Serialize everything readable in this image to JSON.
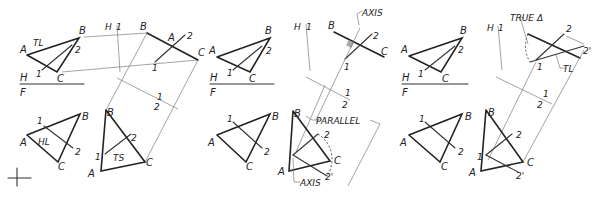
{
  "figure": {
    "panels": [
      {
        "id": "panel-1",
        "top_view_labels": {
          "A": "A",
          "B": "B",
          "C": "C",
          "p1": "1",
          "p2": "2",
          "tl": "TL"
        },
        "fold_line": {
          "upper": "H",
          "lower": "F"
        },
        "front_view_labels": {
          "A": "A",
          "B": "B",
          "C": "C",
          "p1": "1",
          "p2": "2",
          "hl": "HL"
        },
        "aux_view_labels": {
          "h": "H",
          "one": "1",
          "B": "B",
          "A": "A",
          "C": "C",
          "p1": "1",
          "p2": "2"
        },
        "aux_fold": {
          "one": "1",
          "two": "2"
        },
        "second_aux_labels": {
          "B": "B",
          "A": "A",
          "C": "C",
          "p1": "1",
          "p2": "2",
          "ts": "TS"
        }
      },
      {
        "id": "panel-2",
        "top_view_labels": {
          "A": "A",
          "B": "B",
          "C": "C",
          "p1": "1",
          "p2": "2"
        },
        "fold_line": {
          "upper": "H",
          "lower": "F"
        },
        "front_view_labels": {
          "A": "A",
          "B": "B",
          "C": "C",
          "p1": "1",
          "p2": "2"
        },
        "aux_view_labels": {
          "h": "H",
          "one": "1",
          "B": "B",
          "C": "C",
          "p1": "1",
          "p2": "2",
          "axis": "AXIS"
        },
        "aux_fold": {
          "one": "1",
          "two": "2"
        },
        "second_aux_labels": {
          "B": "B",
          "A": "A",
          "C": "C",
          "p2": "2",
          "p2p": "2'",
          "parallel": "PARALLEL",
          "axis": "AXIS"
        }
      },
      {
        "id": "panel-3",
        "top_view_labels": {
          "A": "A",
          "B": "B",
          "C": "C",
          "p1": "1",
          "p2": "2"
        },
        "fold_line": {
          "upper": "H",
          "lower": "F"
        },
        "front_view_labels": {
          "A": "A",
          "B": "B",
          "C": "C",
          "p1": "1",
          "p2": "2"
        },
        "aux_view_labels": {
          "h": "H",
          "one": "1",
          "p1": "1",
          "p2": "2",
          "p2p": "2'",
          "true_angle": "TRUE Δ",
          "tl": "TL"
        },
        "aux_fold": {
          "one": "1",
          "two": "2"
        },
        "second_aux_labels": {
          "B": "B",
          "A": "A",
          "C": "C",
          "p1": "1",
          "p2": "2",
          "p2p": "2'"
        }
      }
    ]
  }
}
